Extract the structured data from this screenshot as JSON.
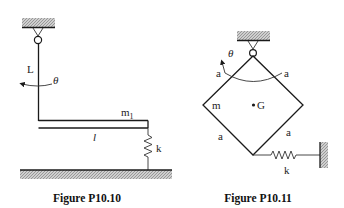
{
  "figures": [
    {
      "id": "P10.10",
      "caption": "Figure P10.10",
      "labels": {
        "rod_length": "L",
        "angle": "θ",
        "mass": "m",
        "mass_subscript": "1",
        "bar_length": "l",
        "spring": "k"
      },
      "elements": [
        "ceiling-support",
        "pivot",
        "vertical-rod",
        "horizontal-bar",
        "spring",
        "ground"
      ]
    },
    {
      "id": "P10.11",
      "caption": "Figure P10.11",
      "labels": {
        "angle": "θ",
        "side_top_left": "a",
        "side_top_right": "a",
        "side_bottom_left": "a",
        "side_bottom_right": "a",
        "mass": "m",
        "center_of_gravity": "G",
        "spring": "k"
      },
      "elements": [
        "ceiling-support",
        "pivot",
        "square-frame",
        "spring",
        "wall"
      ]
    }
  ],
  "colors": {
    "line": "#1a1a1a",
    "hatch": "#9a9a9a",
    "background": "#ffffff"
  }
}
